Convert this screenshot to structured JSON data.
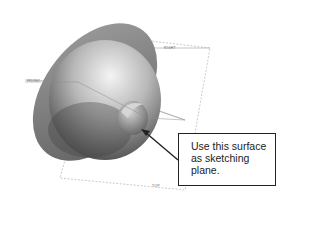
{
  "figure": {
    "datum_planes": {
      "right": "RIGHT",
      "front": "FRONT",
      "top": "TOP"
    },
    "callout": {
      "text": "Use this surface as sketching plane.",
      "lines": [
        "Use this surface",
        "as sketching",
        "plane."
      ]
    },
    "colors": {
      "body_light": "#e6e6e6",
      "body_dark": "#5a5a5a",
      "rim": "#8a8a8a",
      "plane_line": "#9a9a9a",
      "arrow": "#222222"
    }
  }
}
